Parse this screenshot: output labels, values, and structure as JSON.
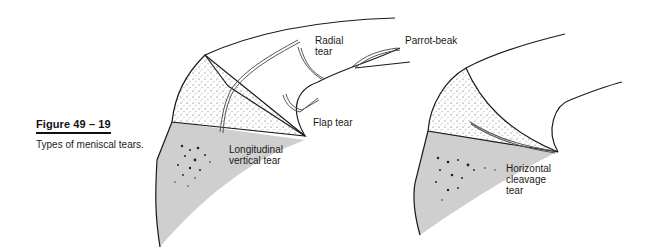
{
  "figure": {
    "label": "Figure 49 – 19",
    "caption": "Types of meniscal tears."
  },
  "left_illustration": {
    "labels": {
      "radial_line1": "Radial",
      "radial_line2": "tear",
      "parrot": "Parrot-beak",
      "flap": "Flap tear",
      "longitudinal_line1": "Longitudinal",
      "longitudinal_line2": "vertical tear"
    }
  },
  "right_illustration": {
    "labels": {
      "horizontal_line1": "Horizontal",
      "horizontal_line2": "cleavage",
      "horizontal_line3": "tear"
    }
  },
  "colors": {
    "stroke": "#1a1a1a",
    "tibia_fill": "#cfcfcf",
    "tear_stroke": "#555555"
  }
}
